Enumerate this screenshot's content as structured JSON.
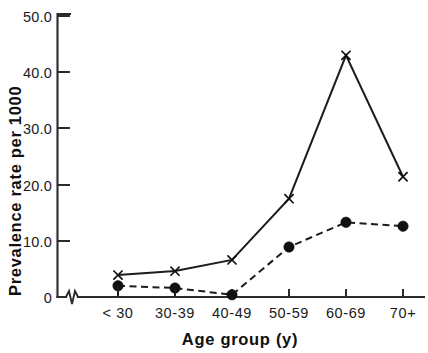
{
  "chart_data": {
    "type": "line",
    "title": "",
    "xlabel": "Age group (y)",
    "ylabel": "Prevalence rate per 1000",
    "categories": [
      "< 30",
      "30-39",
      "40-49",
      "50-59",
      "60-69",
      "70+"
    ],
    "series": [
      {
        "name": "series-x-marker",
        "marker": "x",
        "linestyle": "solid",
        "values": [
          3.9,
          4.6,
          6.6,
          17.5,
          43.0,
          21.4
        ]
      },
      {
        "name": "series-dot-marker",
        "marker": "filled-circle",
        "linestyle": "dashed",
        "values": [
          2.0,
          1.6,
          0.4,
          8.9,
          13.3,
          12.6
        ]
      }
    ],
    "ylim": [
      0,
      50
    ],
    "yticks": [
      0,
      10,
      20,
      30,
      40,
      50
    ],
    "ytick_labels": [
      "0",
      "10.0",
      "20.0",
      "30.0",
      "40.0",
      "50.0"
    ],
    "xtick_labels": [
      "< 30",
      "30-39",
      "40-49",
      "50-59",
      "60-69",
      "70+"
    ],
    "grid": false,
    "legend": "none",
    "axis_break_x": true,
    "line_color": "#1c1c1c",
    "axis_color": "#2b2b2b"
  },
  "axes": {
    "y_title": "Prevalence rate per 1000",
    "x_title": "Age group (y)"
  },
  "ytick_labels": {
    "t0": "0",
    "t10": "10.0",
    "t20": "20.0",
    "t30": "30.0",
    "t40": "40.0",
    "t50": "50.0"
  },
  "xtick_labels": {
    "c0": "< 30",
    "c1": "30-39",
    "c2": "40-49",
    "c3": "50-59",
    "c4": "60-69",
    "c5": "70+"
  }
}
